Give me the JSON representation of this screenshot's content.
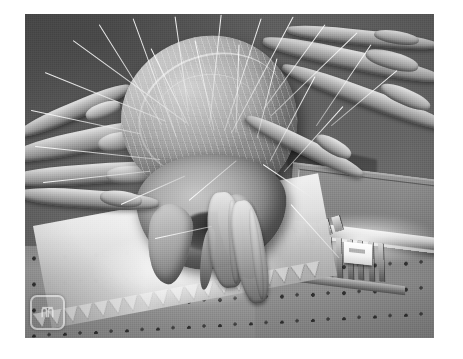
{
  "image": {
    "kind": "sem-micrograph",
    "subject": "house dust mite on a MEMS micromachined gear device",
    "modality": "Scanning Electron Microscope",
    "rendering": "grayscale",
    "frame": {
      "left": 25,
      "top": 14,
      "width": 409,
      "height": 324,
      "page_background": "#ffffff"
    },
    "palette": {
      "background_field": "#5e5e5e",
      "substrate": "#949494",
      "organism_highlight": "#d3d3d3",
      "organism_midtone": "#a6a6a6",
      "organism_shadow": "#6e6e6e",
      "specular_white": "#ffffff",
      "deep_shadow": "#2e2e2e",
      "watermark_stroke": "#fafafa"
    }
  },
  "watermark": {
    "name": "institution-logo",
    "shape": "rounded-square-outline",
    "glyph": "stylized-monogram",
    "opacity": 0.55
  },
  "credit": {
    "text": ""
  },
  "scene": {
    "organism": {
      "label": "dust-mite",
      "parts": [
        {
          "name": "idiosoma-body",
          "description": "large oval textured body, upper center"
        },
        {
          "name": "gnathosoma",
          "description": "mouthpart region below the body"
        },
        {
          "name": "pedipalp-left",
          "description": "left palp hanging toward the wafer"
        },
        {
          "name": "pedipalp-right",
          "description": "right palp reaching the gear"
        },
        {
          "name": "chelicera",
          "description": "central piercing mouthpart"
        }
      ],
      "leg_count": 6,
      "seta_count": 26
    },
    "device": {
      "label": "mems-micromachine",
      "parts": [
        {
          "name": "gear-sawtooth-rim",
          "description": "large sawtooth gear rim crossing the lower third"
        },
        {
          "name": "comb-finger-array",
          "description": "array of parallel comb fingers right of center"
        },
        {
          "name": "raised-bond-pad",
          "description": "raised rectangular pad upper right with bright lip"
        },
        {
          "name": "white-marker-block",
          "description": "bright white block at the right end of the comb"
        },
        {
          "name": "dimpled-substrate",
          "description": "polysilicon floor with regular dimple array"
        }
      ],
      "dimple_grid": {
        "columns": 14,
        "rows": 5,
        "spacing_px": 31
      },
      "comb_fingers": 11,
      "gear_teeth": 19,
      "secondary_gear_teeth": 9
    }
  }
}
